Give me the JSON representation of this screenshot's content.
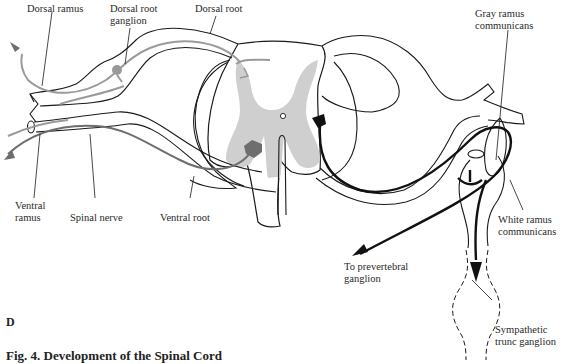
{
  "figure": {
    "panel_letter": "D",
    "caption": "Fig. 4.  Development of the Spinal Cord"
  },
  "labels": {
    "dorsal_ramus": "Dorsal ramus",
    "dorsal_root_ganglion_1": "Dorsal root",
    "dorsal_root_ganglion_2": "ganglion",
    "dorsal_root": "Dorsal root",
    "gray_ramus_1": "Gray ramus",
    "gray_ramus_2": "communicans",
    "ventral_ramus_1": "Ventral",
    "ventral_ramus_2": "ramus",
    "spinal_nerve": "Spinal nerve",
    "ventral_root": "Ventral root",
    "white_ramus_1": "White ramus",
    "white_ramus_2": "communicans",
    "prevertebral_1": "To prevertebral",
    "prevertebral_2": "ganglion",
    "sympathetic_1": "Sympathetic",
    "sympathetic_2": "trunc ganglion"
  },
  "colors": {
    "outline": "#1a1a1a",
    "gray_matter": "#cfcfcf",
    "sensory_fiber": "#9a9a9a",
    "motor_fiber_somatic": "#6e6e6e",
    "autonomic_fiber": "#111111"
  }
}
